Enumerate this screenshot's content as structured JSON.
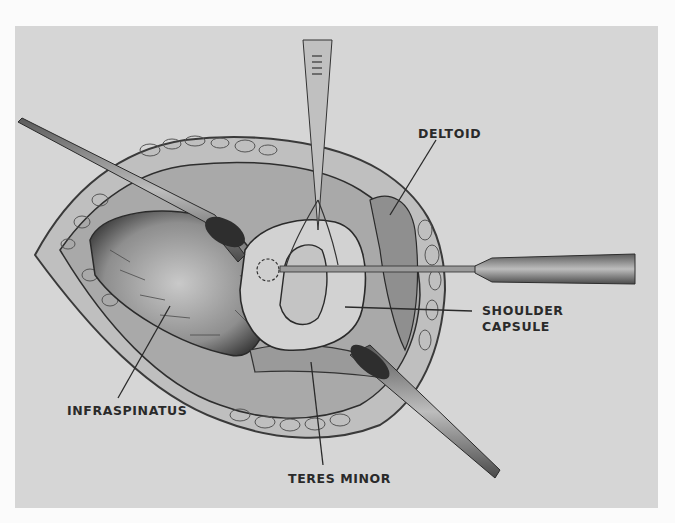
{
  "figure": {
    "type": "surgical-illustration",
    "background_color": "#d6d6d6",
    "ink_color": "#2a2a2a"
  },
  "labels": {
    "deltoid": "DELTOID",
    "shoulder_capsule_line1": "SHOULDER",
    "shoulder_capsule_line2": "CAPSULE",
    "infraspinatus": "INFRASPINATUS",
    "teres_minor": "TERES MINOR"
  }
}
